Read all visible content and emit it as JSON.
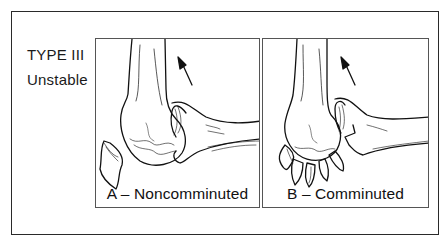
{
  "figure": {
    "type_label": "TYPE III",
    "stability_label": "Unstable",
    "panels": [
      {
        "id": "A",
        "caption": "A – Noncomminuted",
        "description": "elbow joint illustration with single olecranon fracture fragment, arrow indicating displacement"
      },
      {
        "id": "B",
        "caption": "B – Comminuted",
        "description": "elbow joint illustration with multiple comminuted fracture fragments, arrow indicating displacement"
      }
    ],
    "colors": {
      "line": "#111111",
      "border": "#2a2a2a",
      "background": "#ffffff"
    }
  }
}
